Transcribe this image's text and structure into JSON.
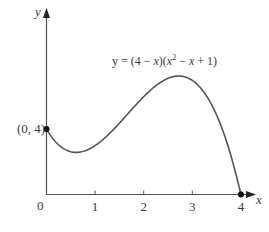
{
  "chart_data": {
    "type": "line",
    "title": "",
    "equation_label": "y = (4 − x)(x² − x + 1)",
    "equation_parts": {
      "prefix": "y = (4 − ",
      "x1": "x",
      "mid": ")(",
      "x2": "x",
      "sup": "2",
      "mid2": " − ",
      "x3": "x",
      "suffix": " + 1)"
    },
    "xlabel": "x",
    "ylabel": "y",
    "x_ticks": [
      "1",
      "2",
      "3",
      "4"
    ],
    "x_tick_values": [
      1,
      2,
      3,
      4
    ],
    "origin_label": "0",
    "xlim": [
      0,
      4.3
    ],
    "ylim": [
      0,
      8
    ],
    "grid": false,
    "legend": null,
    "series": [
      {
        "name": "y = (4 − x)(x² − x + 1)",
        "function": "(4-x)*(x*x-x+1)",
        "x": [
          0,
          0.25,
          0.5,
          0.6,
          0.75,
          1,
          1.25,
          1.5,
          1.75,
          2,
          2.25,
          2.5,
          2.73,
          3,
          3.25,
          3.5,
          3.75,
          4
        ],
        "y": [
          4,
          3.08,
          2.63,
          2.58,
          2.64,
          3.0,
          3.58,
          4.38,
          5.2,
          6.0,
          6.66,
          7.13,
          7.27,
          7.0,
          6.14,
          4.38,
          2.48,
          0
        ]
      }
    ],
    "annotations": [
      {
        "text": "(0, 4)",
        "x": 0,
        "y": 4,
        "marker": "dot"
      },
      {
        "text": "",
        "x": 4,
        "y": 0,
        "marker": "dot"
      }
    ]
  }
}
